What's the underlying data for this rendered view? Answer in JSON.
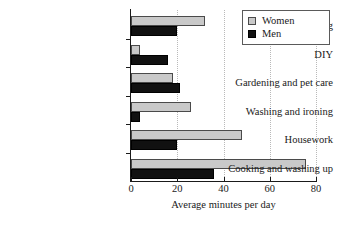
{
  "chart_data": {
    "type": "bar",
    "orientation": "horizontal",
    "title": "",
    "xlabel": "Average minutes per day",
    "ylabel": "",
    "xlim": [
      0,
      80
    ],
    "xticks": [
      0,
      20,
      40,
      60,
      80
    ],
    "xtick_labels": [
      "0",
      "20",
      "40",
      "60",
      "80"
    ],
    "grid": "vertical-dotted",
    "legend_position": "top-right",
    "categories": [
      "Shopping",
      "DIY",
      "Gardening and pet care",
      "Washing and ironing",
      "Housework",
      "Cooking and washing up"
    ],
    "series": [
      {
        "name": "Women",
        "color": "#c9c9c9",
        "values": [
          32,
          4,
          18,
          26,
          48,
          75.5
        ]
      },
      {
        "name": "Men",
        "color": "#111111",
        "values": [
          20,
          16,
          21,
          4,
          20,
          36
        ]
      }
    ]
  },
  "legend": {
    "items": [
      {
        "label": "Women",
        "swatch": "women-swatch"
      },
      {
        "label": "Men",
        "swatch": "men-swatch"
      }
    ]
  }
}
